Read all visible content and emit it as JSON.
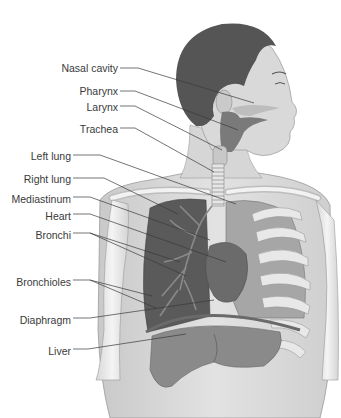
{
  "diagram": {
    "labels": [
      {
        "id": "nasal-cavity",
        "text": "Nasal cavity",
        "x": 90,
        "y": 68,
        "tx": 254,
        "ty": 103
      },
      {
        "id": "pharynx",
        "text": "Pharynx",
        "x": 117,
        "y": 91,
        "tx": 238,
        "ty": 130
      },
      {
        "id": "larynx",
        "text": "Larynx",
        "x": 117,
        "y": 106,
        "tx": 230,
        "ty": 150
      },
      {
        "id": "trachea",
        "text": "Trachea",
        "x": 117,
        "y": 128,
        "tx": 214,
        "ty": 172
      },
      {
        "id": "left-lung",
        "text": "Left lung",
        "x": 70,
        "y": 155,
        "tx": 236,
        "ty": 200
      },
      {
        "id": "right-lung",
        "text": "Right lung",
        "x": 70,
        "y": 178,
        "tx": 183,
        "ty": 214
      },
      {
        "id": "mediastinum",
        "text": "Mediastinum",
        "x": 70,
        "y": 197,
        "tx": 212,
        "ty": 238
      },
      {
        "id": "heart",
        "text": "Heart",
        "x": 70,
        "y": 214,
        "tx": 228,
        "ty": 260
      },
      {
        "id": "bronchi",
        "text": "Bronchi",
        "x": 70,
        "y": 233,
        "tx": 180,
        "ty": 268,
        "tx2": 186,
        "ty2": 278
      },
      {
        "id": "bronchioles",
        "text": "Bronchioles",
        "x": 70,
        "y": 280,
        "tx": 152,
        "ty": 296,
        "tx2": 156,
        "ty2": 306
      },
      {
        "id": "diaphragm",
        "text": "Diaphragm",
        "x": 70,
        "y": 318,
        "tx": 212,
        "ty": 297
      },
      {
        "id": "liver",
        "text": "Liver",
        "x": 70,
        "y": 349,
        "tx": 186,
        "ty": 333
      }
    ]
  }
}
